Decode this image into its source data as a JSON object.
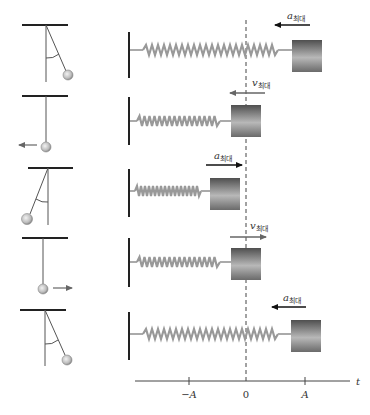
{
  "figure": {
    "colors": {
      "line": "#222222",
      "spring": "#9a9a9a",
      "block_dark": "#555555",
      "block_light": "#b5b5b5",
      "velocity_arrow": "#666666",
      "acceleration_arrow": "#111111",
      "dashed_line": "#444444"
    }
  },
  "rows": [
    {
      "pendulum": "displaced-right",
      "block_position": "A",
      "vector": {
        "symbol": "a",
        "subscript": "최대",
        "direction": "left",
        "kind": "acceleration"
      }
    },
    {
      "pendulum": "vertical-moving-left",
      "block_position": "0",
      "vector": {
        "symbol": "v",
        "subscript": "최대",
        "direction": "left",
        "kind": "velocity"
      }
    },
    {
      "pendulum": "displaced-left",
      "block_position": "-A",
      "vector": {
        "symbol": "a",
        "subscript": "최대",
        "direction": "right",
        "kind": "acceleration"
      }
    },
    {
      "pendulum": "vertical-moving-right",
      "block_position": "0",
      "vector": {
        "symbol": "v",
        "subscript": "최대",
        "direction": "right",
        "kind": "velocity"
      }
    },
    {
      "pendulum": "displaced-right",
      "block_position": "A",
      "vector": {
        "symbol": "a",
        "subscript": "최대",
        "direction": "left",
        "kind": "acceleration"
      }
    }
  ],
  "labels": {
    "row1_sym": "a",
    "row1_sub": "최대",
    "row2_sym": "v",
    "row2_sub": "최대",
    "row3_sym": "a",
    "row3_sub": "최대",
    "row4_sym": "v",
    "row4_sub": "최대",
    "row5_sym": "a",
    "row5_sub": "최대"
  },
  "axis": {
    "ticks": [
      "−A",
      "0",
      "A"
    ],
    "variable": "t"
  }
}
